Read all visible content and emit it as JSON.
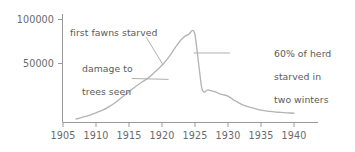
{
  "chart_data": {
    "type": "line",
    "title": "",
    "xlabel": "",
    "ylabel": "",
    "xlim": [
      1905,
      1941
    ],
    "ylim": [
      0,
      115000
    ],
    "grid": false,
    "legend": null,
    "y_ticks": [
      50000,
      100000
    ],
    "y_tick_labels": [
      "50000",
      "100000"
    ],
    "x_ticks": [
      1905,
      1910,
      1915,
      1920,
      1925,
      1930,
      1935,
      1940
    ],
    "x_tick_labels": [
      "1905",
      "1910",
      "1915",
      "1920",
      "1925",
      "1930",
      "1935",
      "1940"
    ],
    "series": [
      {
        "name": "Kaibab deer herd population",
        "x": [
          1907,
          1908,
          1909,
          1910,
          1911,
          1912,
          1913,
          1914,
          1915,
          1916,
          1917,
          1918,
          1919,
          1920,
          1921,
          1922,
          1923,
          1924,
          1925,
          1926,
          1927,
          1928,
          1929,
          1930,
          1931,
          1932,
          1933,
          1934,
          1935,
          1936,
          1937,
          1938,
          1939,
          1940
        ],
        "values": [
          4000,
          6000,
          8000,
          11000,
          14000,
          18000,
          23000,
          29000,
          35000,
          41000,
          46000,
          51000,
          58000,
          65000,
          74000,
          85000,
          95000,
          100000,
          100000,
          40000,
          37000,
          35000,
          32000,
          30000,
          25000,
          21000,
          18000,
          16000,
          14000,
          13000,
          12000,
          11500,
          11000,
          10500
        ]
      }
    ],
    "annotations": [
      {
        "id": "first-fawns-starved",
        "text": "first fawns starved",
        "text_x": 1907.3,
        "text_y": 103000,
        "leader_from": [
          1917.6,
          97000
        ],
        "leader_to": [
          1920.2,
          65000
        ]
      },
      {
        "id": "damage-to-trees-seen",
        "text_line1": "damage to",
        "text_line2": "trees seen",
        "text_x": 1907.3,
        "text_y": 72000,
        "leader_from": [
          1915.4,
          50000
        ],
        "leader_to": [
          1921.0,
          49000
        ]
      },
      {
        "id": "sixty-percent-starved",
        "text_line1": "60% of herd",
        "text_line2": "starved in",
        "text_line3": "two winters",
        "text_x": 1934.0,
        "text_y": 93000,
        "leader_from": [
          1930.3,
          79000
        ],
        "leader_to": [
          1924.8,
          79000
        ]
      }
    ]
  },
  "style": {
    "line_color": "#b4b4b4",
    "axis_color": "#9a9a9a",
    "text_color": "#5a5a5a",
    "tick_text_color": "#6a6a6a",
    "background": "#ffffff"
  }
}
